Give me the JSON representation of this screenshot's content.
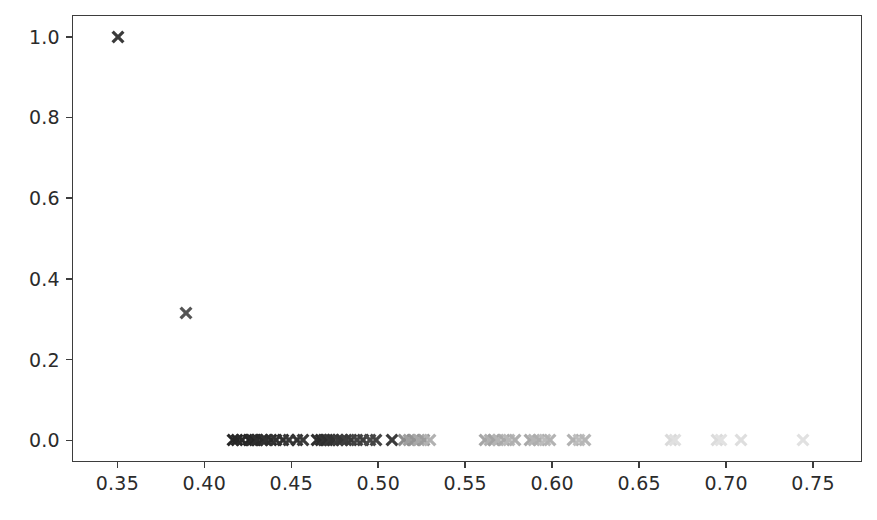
{
  "chart_data": {
    "type": "scatter",
    "title": "",
    "xlabel": "",
    "ylabel": "",
    "xlim": [
      0.3239,
      0.7781
    ],
    "ylim": [
      -0.0537,
      1.0538
    ],
    "grid": false,
    "legend": null,
    "marker": "x",
    "xticks": [
      0.35,
      0.4,
      0.45,
      0.5,
      0.55,
      0.6,
      0.65,
      0.7,
      0.75
    ],
    "xtick_labels": [
      "0.35",
      "0.40",
      "0.45",
      "0.50",
      "0.55",
      "0.60",
      "0.65",
      "0.70",
      "0.75"
    ],
    "yticks": [
      0.0,
      0.2,
      0.4,
      0.6,
      0.8,
      1.0
    ],
    "ytick_labels": [
      "0.0",
      "0.2",
      "0.4",
      "0.6",
      "0.8",
      "1.0"
    ],
    "points": [
      {
        "x": 0.3502,
        "y": 1.0,
        "shade": "#3a3a3a"
      },
      {
        "x": 0.3896,
        "y": 0.315,
        "shade": "#555555"
      },
      {
        "x": 0.4163,
        "y": 0.0,
        "shade": "#262626"
      },
      {
        "x": 0.4186,
        "y": 0.0,
        "shade": "#262626"
      },
      {
        "x": 0.4215,
        "y": 0.0,
        "shade": "#292929"
      },
      {
        "x": 0.4254,
        "y": 0.0,
        "shade": "#262626"
      },
      {
        "x": 0.4272,
        "y": 0.0,
        "shade": "#2b2b2b"
      },
      {
        "x": 0.4289,
        "y": 0.0,
        "shade": "#262626"
      },
      {
        "x": 0.4305,
        "y": 0.0,
        "shade": "#2e2e2e"
      },
      {
        "x": 0.433,
        "y": 0.0,
        "shade": "#2a2a2a"
      },
      {
        "x": 0.4352,
        "y": 0.0,
        "shade": "#303030"
      },
      {
        "x": 0.4381,
        "y": 0.0,
        "shade": "#2c2c2c"
      },
      {
        "x": 0.4414,
        "y": 0.0,
        "shade": "#333333"
      },
      {
        "x": 0.4452,
        "y": 0.0,
        "shade": "#303030"
      },
      {
        "x": 0.4487,
        "y": 0.0,
        "shade": "#373737"
      },
      {
        "x": 0.4531,
        "y": 0.0,
        "shade": "#333333"
      },
      {
        "x": 0.4566,
        "y": 0.0,
        "shade": "#3a3a3a"
      },
      {
        "x": 0.4647,
        "y": 0.0,
        "shade": "#2f2f2f"
      },
      {
        "x": 0.4668,
        "y": 0.0,
        "shade": "#2d2d2d"
      },
      {
        "x": 0.4687,
        "y": 0.0,
        "shade": "#343434"
      },
      {
        "x": 0.4705,
        "y": 0.0,
        "shade": "#2f2f2f"
      },
      {
        "x": 0.4723,
        "y": 0.0,
        "shade": "#373737"
      },
      {
        "x": 0.4742,
        "y": 0.0,
        "shade": "#323232"
      },
      {
        "x": 0.4766,
        "y": 0.0,
        "shade": "#3a3a3a"
      },
      {
        "x": 0.479,
        "y": 0.0,
        "shade": "#363636"
      },
      {
        "x": 0.4815,
        "y": 0.0,
        "shade": "#3e3e3e"
      },
      {
        "x": 0.4845,
        "y": 0.0,
        "shade": "#3a3a3a"
      },
      {
        "x": 0.4878,
        "y": 0.0,
        "shade": "#434343"
      },
      {
        "x": 0.4913,
        "y": 0.0,
        "shade": "#3e3e3e"
      },
      {
        "x": 0.495,
        "y": 0.0,
        "shade": "#484848"
      },
      {
        "x": 0.4987,
        "y": 0.0,
        "shade": "#444444"
      },
      {
        "x": 0.5079,
        "y": 0.0,
        "shade": "#3b3b3b"
      },
      {
        "x": 0.5146,
        "y": 0.0,
        "shade": "#8c8c8c"
      },
      {
        "x": 0.5178,
        "y": 0.0,
        "shade": "#9f9f9f"
      },
      {
        "x": 0.5205,
        "y": 0.0,
        "shade": "#949494"
      },
      {
        "x": 0.5233,
        "y": 0.0,
        "shade": "#a8a8a8"
      },
      {
        "x": 0.5262,
        "y": 0.0,
        "shade": "#9c9c9c"
      },
      {
        "x": 0.5295,
        "y": 0.0,
        "shade": "#b1b1b1"
      },
      {
        "x": 0.5611,
        "y": 0.0,
        "shade": "#a6a6a6"
      },
      {
        "x": 0.564,
        "y": 0.0,
        "shade": "#b0b0b0"
      },
      {
        "x": 0.5666,
        "y": 0.0,
        "shade": "#a3a3a3"
      },
      {
        "x": 0.5691,
        "y": 0.0,
        "shade": "#b4b4b4"
      },
      {
        "x": 0.572,
        "y": 0.0,
        "shade": "#aaaaaa"
      },
      {
        "x": 0.5752,
        "y": 0.0,
        "shade": "#b8b8b8"
      },
      {
        "x": 0.5786,
        "y": 0.0,
        "shade": "#afafaf"
      },
      {
        "x": 0.587,
        "y": 0.0,
        "shade": "#a9a9a9"
      },
      {
        "x": 0.5898,
        "y": 0.0,
        "shade": "#b5b5b5"
      },
      {
        "x": 0.5925,
        "y": 0.0,
        "shade": "#aeaeae"
      },
      {
        "x": 0.5956,
        "y": 0.0,
        "shade": "#bcbcbc"
      },
      {
        "x": 0.5988,
        "y": 0.0,
        "shade": "#b3b3b3"
      },
      {
        "x": 0.612,
        "y": 0.0,
        "shade": "#b2b2b2"
      },
      {
        "x": 0.6154,
        "y": 0.0,
        "shade": "#bdbdbd"
      },
      {
        "x": 0.6186,
        "y": 0.0,
        "shade": "#b6b6b6"
      },
      {
        "x": 0.6681,
        "y": 0.0,
        "shade": "#dadada"
      },
      {
        "x": 0.6707,
        "y": 0.0,
        "shade": "#e0e0e0"
      },
      {
        "x": 0.6945,
        "y": 0.0,
        "shade": "#dcdcdc"
      },
      {
        "x": 0.6973,
        "y": 0.0,
        "shade": "#e2e2e2"
      },
      {
        "x": 0.7085,
        "y": 0.0,
        "shade": "#dedede"
      },
      {
        "x": 0.7443,
        "y": 0.0,
        "shade": "#e1e1e1"
      }
    ]
  },
  "axes": {
    "frame_color": "#3d3d3d",
    "tick_color": "#3d3d3d",
    "label_color": "#2b2b2b",
    "background": "#ffffff"
  }
}
